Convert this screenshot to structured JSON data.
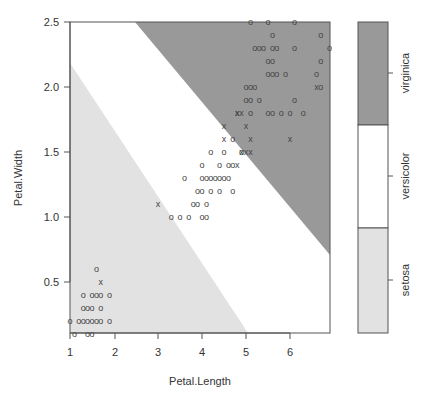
{
  "chart_data": {
    "type": "scatter",
    "title": "",
    "xlabel": "Petal.Length",
    "ylabel": "Petal.Width",
    "xlim": [
      1,
      6.9
    ],
    "ylim": [
      0.1,
      2.5
    ],
    "x_ticks": [
      "1",
      "2",
      "3",
      "4",
      "5",
      "6"
    ],
    "y_ticks": [
      "0.5",
      "1.0",
      "1.5",
      "2.0",
      "2.5"
    ],
    "grid": false,
    "background_regions": [
      {
        "class": "setosa",
        "color": "#e2e2e2",
        "description": "lower-left triangle below line from (1,2.18) to (5.05,0.1)"
      },
      {
        "class": "versicolor",
        "color": "#ffffff",
        "description": "diagonal band between setosa and virginica regions"
      },
      {
        "class": "virginica",
        "color": "#999999",
        "description": "upper-right region above line from (2.5,2.5) to (6.9,0.7)"
      }
    ],
    "legend": {
      "position": "right",
      "type": "colorbar",
      "entries": [
        {
          "label": "virginica",
          "color": "#999999"
        },
        {
          "label": "versicolor",
          "color": "#ffffff"
        },
        {
          "label": "setosa",
          "color": "#e2e2e2"
        }
      ]
    },
    "markers": {
      "o": "correctly classified / training point",
      "x": "support vector / misclassified point"
    },
    "series": [
      {
        "name": "setosa",
        "marker": "o",
        "points": [
          [
            1.0,
            0.2
          ],
          [
            1.1,
            0.1
          ],
          [
            1.2,
            0.2
          ],
          [
            1.3,
            0.2
          ],
          [
            1.4,
            0.2
          ],
          [
            1.5,
            0.2
          ],
          [
            1.6,
            0.2
          ],
          [
            1.7,
            0.2
          ],
          [
            1.9,
            0.2
          ],
          [
            1.3,
            0.3
          ],
          [
            1.4,
            0.3
          ],
          [
            1.5,
            0.3
          ],
          [
            1.7,
            0.3
          ],
          [
            1.3,
            0.4
          ],
          [
            1.5,
            0.4
          ],
          [
            1.6,
            0.4
          ],
          [
            1.7,
            0.4
          ],
          [
            1.9,
            0.4
          ],
          [
            1.6,
            0.6
          ],
          [
            1.4,
            0.1
          ],
          [
            1.5,
            0.1
          ]
        ]
      },
      {
        "name": "setosa-sv",
        "marker": "x",
        "points": [
          [
            1.7,
            0.5
          ]
        ]
      },
      {
        "name": "versicolor",
        "marker": "o",
        "points": [
          [
            3.3,
            1.0
          ],
          [
            3.5,
            1.0
          ],
          [
            3.7,
            1.0
          ],
          [
            4.0,
            1.0
          ],
          [
            4.1,
            1.0
          ],
          [
            3.9,
            1.1
          ],
          [
            4.1,
            1.1
          ],
          [
            3.8,
            1.1
          ],
          [
            3.9,
            1.2
          ],
          [
            4.0,
            1.2
          ],
          [
            4.2,
            1.2
          ],
          [
            4.4,
            1.2
          ],
          [
            4.7,
            1.2
          ],
          [
            4.0,
            1.3
          ],
          [
            4.1,
            1.3
          ],
          [
            4.2,
            1.3
          ],
          [
            4.3,
            1.3
          ],
          [
            4.4,
            1.3
          ],
          [
            4.5,
            1.3
          ],
          [
            4.6,
            1.3
          ],
          [
            3.6,
            1.3
          ],
          [
            4.0,
            1.4
          ],
          [
            4.4,
            1.4
          ],
          [
            4.6,
            1.4
          ],
          [
            4.7,
            1.4
          ],
          [
            4.5,
            1.5
          ],
          [
            4.9,
            1.5
          ],
          [
            4.2,
            1.5
          ],
          [
            4.7,
            1.6
          ]
        ]
      },
      {
        "name": "versicolor-sv",
        "marker": "x",
        "points": [
          [
            3.0,
            1.1
          ],
          [
            4.8,
            1.4
          ],
          [
            5.0,
            1.7
          ],
          [
            4.5,
            1.7
          ],
          [
            4.9,
            1.5
          ],
          [
            5.1,
            1.6
          ],
          [
            4.8,
            1.8
          ],
          [
            4.5,
            1.6
          ]
        ]
      },
      {
        "name": "virginica",
        "marker": "o",
        "points": [
          [
            5.1,
            2.5
          ],
          [
            5.5,
            2.5
          ],
          [
            5.6,
            2.4
          ],
          [
            5.2,
            2.3
          ],
          [
            5.4,
            2.3
          ],
          [
            5.6,
            2.3
          ],
          [
            5.7,
            2.3
          ],
          [
            6.1,
            2.3
          ],
          [
            6.7,
            2.4
          ],
          [
            5.3,
            2.3
          ],
          [
            5.5,
            2.2
          ],
          [
            5.6,
            2.2
          ],
          [
            6.7,
            2.2
          ],
          [
            5.5,
            2.1
          ],
          [
            5.6,
            2.1
          ],
          [
            5.7,
            2.1
          ],
          [
            5.9,
            2.1
          ],
          [
            6.6,
            2.1
          ],
          [
            5.0,
            2.0
          ],
          [
            5.1,
            2.0
          ],
          [
            5.2,
            2.0
          ],
          [
            6.7,
            2.0
          ],
          [
            5.1,
            1.9
          ],
          [
            5.3,
            1.9
          ],
          [
            6.1,
            1.9
          ],
          [
            5.1,
            1.8
          ],
          [
            5.6,
            1.8
          ],
          [
            6.0,
            1.8
          ],
          [
            5.8,
            1.8
          ],
          [
            5.5,
            1.8
          ],
          [
            6.3,
            1.8
          ],
          [
            6.9,
            2.3
          ],
          [
            5.0,
            1.9
          ],
          [
            6.1,
            2.5
          ]
        ]
      },
      {
        "name": "virginica-sv",
        "marker": "x",
        "points": [
          [
            4.9,
            1.8
          ],
          [
            5.0,
            1.5
          ],
          [
            4.8,
            1.8
          ],
          [
            6.6,
            2.0
          ],
          [
            5.1,
            1.5
          ],
          [
            6.0,
            1.6
          ]
        ]
      }
    ]
  },
  "axes": {
    "x_title": "Petal.Length",
    "y_title": "Petal.Width",
    "x_ticks": [
      {
        "label": "1",
        "x": 70
      },
      {
        "label": "2",
        "x": 115
      },
      {
        "label": "3",
        "x": 158
      },
      {
        "label": "4",
        "x": 202
      },
      {
        "label": "5",
        "x": 246
      },
      {
        "label": "6",
        "x": 290
      }
    ],
    "y_ticks": [
      {
        "label": "2.5",
        "y": 22
      },
      {
        "label": "2.0",
        "y": 87
      },
      {
        "label": "1.5",
        "y": 152
      },
      {
        "label": "1.0",
        "y": 217
      },
      {
        "label": "0.5",
        "y": 282
      }
    ]
  },
  "legend": {
    "labels": [
      "virginica",
      "versicolor",
      "setosa"
    ]
  },
  "colors": {
    "setosa": "#e2e2e2",
    "versicolor": "#ffffff",
    "virginica": "#999999",
    "axis": "#555555",
    "marker": "#444444"
  }
}
